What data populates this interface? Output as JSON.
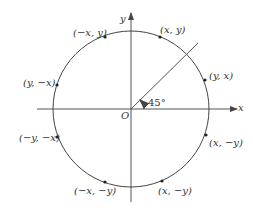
{
  "diagram": {
    "axes": {
      "x_label": "x",
      "y_label": "y",
      "origin_label": "O"
    },
    "angle_label": "45°",
    "points": [
      {
        "label": "(x, y)"
      },
      {
        "label": "(y, x)"
      },
      {
        "label": "(−x, y)"
      },
      {
        "label": "(y, −x)"
      },
      {
        "label": "(−y, −x)"
      },
      {
        "label": "(−x, −y)"
      },
      {
        "label": "(x, −y)"
      },
      {
        "label": "(x, −y)"
      }
    ],
    "colors": {
      "stroke": "#444444",
      "text": "#333333",
      "background": "#ffffff"
    }
  }
}
